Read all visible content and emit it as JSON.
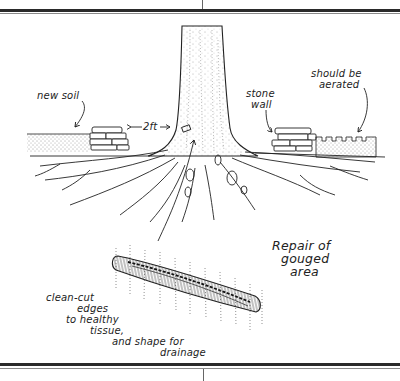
{
  "figure": {
    "title": "Repair of gouged area",
    "title_lines": [
      "Repair of",
      "gouged",
      "area"
    ],
    "labels": {
      "new_soil": "new soil",
      "distance": "2ft",
      "stone_wall_lines": [
        "stone",
        "wall"
      ],
      "aerated_lines": [
        "should be",
        "aerated"
      ],
      "cut_note_lines": [
        "clean-cut",
        "edges",
        "to healthy",
        "tissue,",
        "and shape for",
        "drainage"
      ]
    },
    "colors": {
      "ink": "#222222",
      "paper": "#ffffff",
      "rule": "#2a2a2a"
    }
  }
}
